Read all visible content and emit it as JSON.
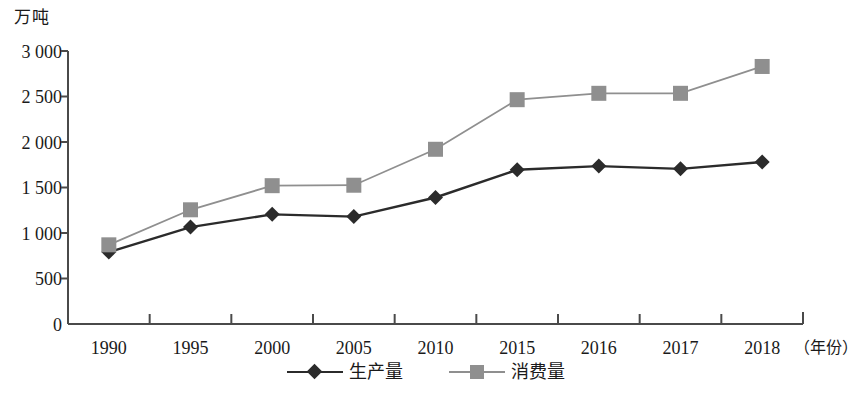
{
  "chart_data": {
    "type": "line",
    "title": "",
    "xlabel": "年份",
    "ylabel": "万吨",
    "x": [
      "1990",
      "1995",
      "2000",
      "2005",
      "2010",
      "2015",
      "2016",
      "2017",
      "2018"
    ],
    "categories": [
      "1990",
      "1995",
      "2000",
      "2005",
      "2010",
      "2015",
      "2016",
      "2017",
      "2018"
    ],
    "series": [
      {
        "name": "生产量",
        "marker": "diamond",
        "color": "#2b2b2b",
        "values": [
          790,
          1065,
          1205,
          1180,
          1390,
          1695,
          1735,
          1705,
          1780
        ]
      },
      {
        "name": "消费量",
        "marker": "square",
        "color": "#8f8f8f",
        "values": [
          870,
          1255,
          1520,
          1525,
          1920,
          2465,
          2535,
          2535,
          2830
        ]
      }
    ],
    "ylim": [
      0,
      3000
    ],
    "y_ticks": [
      0,
      500,
      1000,
      1500,
      2000,
      2500,
      3000
    ],
    "y_tick_labels": [
      "0",
      "500",
      "1 000",
      "1 500",
      "2 000",
      "2 500",
      "3 000"
    ],
    "grid": false,
    "legend_position": "bottom"
  },
  "axes": {
    "y_title": "万吨",
    "x_unit": "（年份）",
    "y_tick_labels": [
      "3 000",
      "2 500",
      "2 000",
      "1 500",
      "1 000",
      "500",
      "0"
    ],
    "x_tick_labels": [
      "1990",
      "1995",
      "2000",
      "2005",
      "2010",
      "2015",
      "2016",
      "2017",
      "2018"
    ]
  },
  "legend": {
    "items": [
      {
        "label": "生产量",
        "color": "#2b2b2b",
        "marker": "diamond"
      },
      {
        "label": "消费量",
        "color": "#8f8f8f",
        "marker": "square"
      }
    ]
  },
  "colors": {
    "production": "#2b2b2b",
    "consumption": "#8f8f8f",
    "axis": "#4a4a4a",
    "background": "#ffffff"
  }
}
